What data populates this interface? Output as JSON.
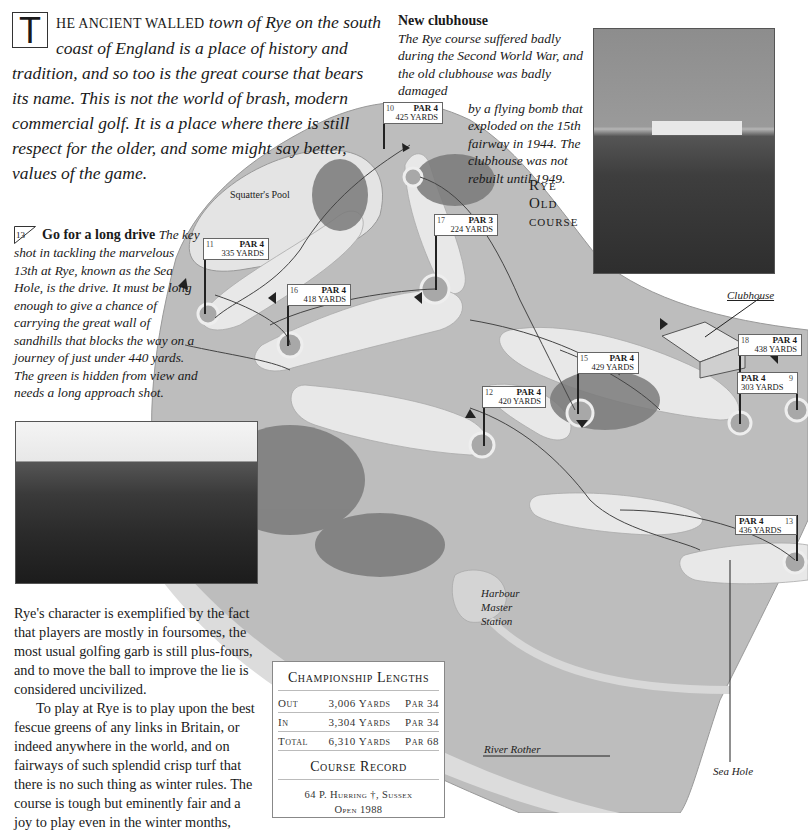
{
  "intro": {
    "dropcap": "T",
    "smallcaps_lead": "HE ANCIENT WALLED",
    "text": " town of Rye on the south coast of England is a place of history and tradition, and so too is the great course that bears its name. This is not the world of brash, modern commercial golf. It is a place where there is still respect for the older, and some might say better, values of the game."
  },
  "clubhouse_note": {
    "heading": "New clubhouse",
    "text_top": "The Rye course suffered badly during the Second World War, and the old clubhouse was badly damaged",
    "text_indented": "by a flying bomb that exploded on the 15th fairway in 1944. The clubhouse was not rebuilt until 1949."
  },
  "course_title": {
    "line1": "Rye",
    "line2": "Old",
    "line3": "course"
  },
  "drive_note": {
    "hole": "13",
    "heading": "Go for a long drive",
    "text": "The key shot in tackling the marvelous 13th at Rye, known as the Sea Hole, is the drive. It must be long enough to give a chance of carrying the great wall of sandhills that blocks the way on a journey of just under 440 yards. The green is hidden from view and needs a long approach shot."
  },
  "body_text": {
    "p1": "Rye's character is exemplified by the fact that players are mostly in foursomes, the most usual golfing garb is still plus-fours, and to move the ball to improve the lie is considered uncivilized.",
    "p2": "To play at Rye is to play upon the best fescue greens of any links in Britain, or indeed anywhere in the world, and on fairways of such splendid crisp turf that there is no such thing as winter rules. The course is tough but eminently fair and a joy to play even in the winter months,"
  },
  "championship_lengths": {
    "title": "Championship Lengths",
    "rows": [
      {
        "label": "Out",
        "yards": "3,006 Yards",
        "par": "Par 34"
      },
      {
        "label": "In",
        "yards": "3,304 Yards",
        "par": "Par 34"
      },
      {
        "label": "Total",
        "yards": "6,310 Yards",
        "par": "Par 68"
      }
    ],
    "record_title": "Course Record",
    "record_line1": "64 P. Hurring †, Sussex",
    "record_line2": "Open 1988"
  },
  "map_labels": {
    "squatters_pool": "Squatter's Pool",
    "clubhouse": "Clubhouse",
    "harbour": "Harbour Master Station",
    "river": "River Rother",
    "sea_hole": "Sea Hole"
  },
  "holes": [
    {
      "num": "10",
      "par": "PAR 4",
      "yards": "425 YARDS"
    },
    {
      "num": "11",
      "par": "PAR 4",
      "yards": "335 YARDS"
    },
    {
      "num": "17",
      "par": "PAR 3",
      "yards": "224 YARDS"
    },
    {
      "num": "16",
      "par": "PAR 4",
      "yards": "418 YARDS"
    },
    {
      "num": "15",
      "par": "PAR 4",
      "yards": "429 YARDS"
    },
    {
      "num": "12",
      "par": "PAR 4",
      "yards": "420 YARDS"
    },
    {
      "num": "18",
      "par": "PAR 4",
      "yards": "438 YARDS"
    },
    {
      "num": "9",
      "par": "PAR 4",
      "yards": "303 YARDS"
    },
    {
      "num": "13",
      "par": "PAR 4",
      "yards": "436 YARDS"
    }
  ],
  "colors": {
    "rough": "#bdbdbd",
    "fairway": "#e6e6e6",
    "trees": "#7a7a7a",
    "outline": "#888888"
  }
}
